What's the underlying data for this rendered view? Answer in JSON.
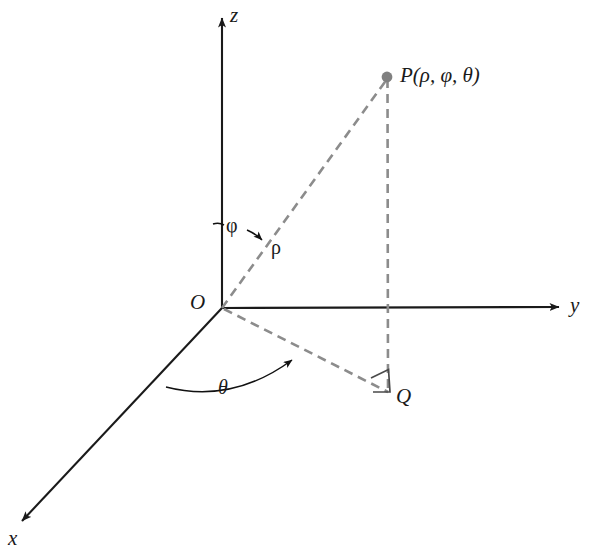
{
  "figure": {
    "background_color": "#ffffff",
    "axis_color": "#1a1a1a",
    "dashed_color": "#8c8c8c",
    "point_color": "#808080",
    "labels": {
      "z_axis": "z",
      "y_axis": "y",
      "x_axis": "x",
      "origin": "O",
      "point_p": "P(ρ, φ, θ)",
      "point_q": "Q",
      "rho": "ρ",
      "phi": "φ",
      "theta": "θ"
    },
    "geometry": {
      "origin": [
        222,
        308
      ],
      "z_axis_tip": [
        222,
        15
      ],
      "y_axis_tip": [
        563,
        307
      ],
      "x_axis_tip": [
        18,
        525
      ],
      "point_p": [
        387,
        77
      ],
      "point_q": [
        388,
        392
      ],
      "rho_segment": [
        [
          222,
          308
        ],
        [
          387,
          77
        ]
      ],
      "pq_segment": [
        [
          387,
          77
        ],
        [
          388,
          392
        ]
      ],
      "oq_segment": [
        [
          222,
          308
        ],
        [
          388,
          392
        ]
      ],
      "qy_segment": [
        [
          388,
          392
        ],
        [
          388,
          307
        ]
      ],
      "theta_arc_start": [
        168,
        385
      ],
      "theta_arc_end": [
        296,
        357
      ],
      "phi_arc_center": [
        222,
        308
      ],
      "right_angle_marker": [
        [
          371,
          378
        ],
        [
          388,
          370
        ],
        [
          390,
          392
        ],
        [
          373,
          392
        ]
      ]
    }
  }
}
